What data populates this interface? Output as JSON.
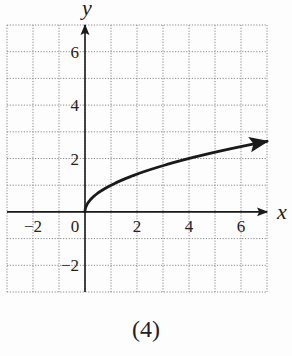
{
  "chart_data": {
    "type": "line",
    "title": "",
    "caption": "(4)",
    "xlabel": "x",
    "ylabel": "y",
    "xlim": [
      -3,
      7
    ],
    "ylim": [
      -3,
      7
    ],
    "grid": true,
    "grid_style": "dotted",
    "x_ticks": [
      -2,
      0,
      2,
      4,
      6
    ],
    "y_ticks": [
      -2,
      2,
      4,
      6
    ],
    "x_tick_labels": [
      "-2",
      "0",
      "2",
      "4",
      "6"
    ],
    "y_tick_labels": [
      "-2",
      "2",
      "4",
      "6"
    ],
    "series": [
      {
        "name": "y = sqrt(x)",
        "function": "sqrt(x)",
        "x": [
          0,
          0.25,
          1,
          2,
          3,
          4,
          5,
          6,
          7
        ],
        "y": [
          0,
          0.5,
          1,
          1.41,
          1.73,
          2,
          2.24,
          2.45,
          2.65
        ],
        "arrow_end": true
      }
    ],
    "legend": null
  },
  "labels": {
    "x_axis": "x",
    "y_axis": "y",
    "caption": "(4)"
  },
  "colors": {
    "curve": "#1a1a1a",
    "axis": "#1a1a1a",
    "grid": "#8a8a8a",
    "background": "#fdfdfd"
  }
}
